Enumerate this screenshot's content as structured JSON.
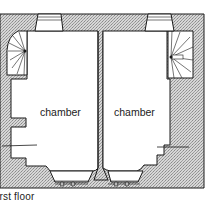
{
  "diagram": {
    "type": "architectural floor plan",
    "caption": "irst floor",
    "rooms": [
      {
        "label": "chamber",
        "position": "left"
      },
      {
        "label": "chamber",
        "position": "right"
      }
    ],
    "features": {
      "staircases": [
        "spiral-stair-left",
        "spiral-stair-right"
      ],
      "top_windows": 2,
      "bottom_windows": 2,
      "wall_hatching": "stipple"
    },
    "colors": {
      "background": "#ffffff",
      "wall_fill": "#c8c8c8",
      "line": "#1a1a1a"
    }
  }
}
